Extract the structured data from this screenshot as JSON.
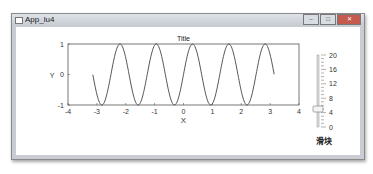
{
  "window": {
    "title": "App_lu4",
    "buttons": [
      "minimize",
      "maximize",
      "close"
    ]
  },
  "chart_data": {
    "type": "line",
    "title": "Title",
    "xlabel": "X",
    "ylabel": "Y",
    "xlim": [
      -4,
      4
    ],
    "ylim": [
      -1,
      1
    ],
    "xticks": [
      -4,
      -3,
      -2,
      -1,
      0,
      1,
      2,
      3,
      4
    ],
    "yticks": [
      -1,
      0,
      1
    ],
    "series": [
      {
        "name": "y = sin(5x)",
        "function": "sin(5x)",
        "x_range": [
          -3.14,
          3.14
        ]
      }
    ],
    "grid": false
  },
  "slider": {
    "label": "滑块",
    "min": 0,
    "max": 20,
    "value": 5,
    "major_ticks": [
      0,
      4,
      8,
      12,
      16,
      20
    ]
  }
}
